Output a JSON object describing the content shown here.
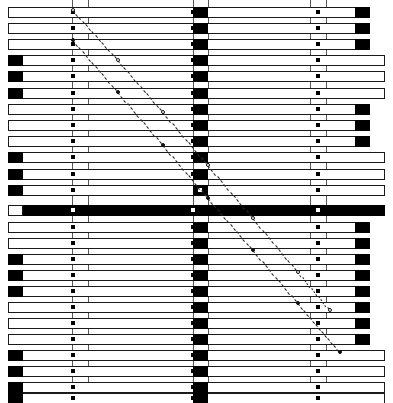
{
  "figure": {
    "title": "",
    "width": 393,
    "height": 403,
    "background": "#ffffff",
    "ink_color": "#000000",
    "grid_color": "#3a3a3a"
  },
  "chart_data": {
    "type": "bar",
    "orientation": "horizontal",
    "title": "",
    "subtitle": "",
    "xlabel": "",
    "ylabel": "",
    "grid": true,
    "legend": null,
    "xlim": [
      0,
      393
    ],
    "ylim": [
      0,
      25
    ],
    "vertical_gridlines": [
      72,
      88,
      193,
      208,
      310,
      326
    ],
    "marker_columns": [
      73,
      193,
      318
    ],
    "categories": [
      "row-01",
      "row-02",
      "row-03",
      "row-04",
      "row-05",
      "row-06",
      "row-07",
      "row-08",
      "row-09",
      "row-10",
      "row-11",
      "row-12",
      "row-13",
      "row-14",
      "row-15",
      "row-16",
      "row-17",
      "row-18",
      "row-19",
      "row-20",
      "row-21",
      "row-22",
      "row-23",
      "row-24",
      "row-25"
    ],
    "rows": [
      {
        "index": 1,
        "y": 7,
        "bar_start": 8,
        "bar_end": 370,
        "left_cap": false,
        "right_cap": true,
        "inverted": false,
        "markers": [
          73,
          193,
          318
        ]
      },
      {
        "index": 2,
        "y": 23,
        "bar_start": 8,
        "bar_end": 370,
        "left_cap": false,
        "right_cap": true,
        "inverted": false,
        "markers": [
          73,
          193,
          318
        ]
      },
      {
        "index": 3,
        "y": 39,
        "bar_start": 8,
        "bar_end": 370,
        "left_cap": false,
        "right_cap": true,
        "inverted": false,
        "markers": [
          73,
          193,
          318
        ]
      },
      {
        "index": 4,
        "y": 55,
        "bar_start": 8,
        "bar_end": 385,
        "left_cap": true,
        "right_cap": false,
        "inverted": false,
        "markers": [
          73,
          193,
          318
        ]
      },
      {
        "index": 5,
        "y": 71,
        "bar_start": 8,
        "bar_end": 385,
        "left_cap": true,
        "right_cap": false,
        "inverted": false,
        "markers": [
          73,
          193,
          318
        ]
      },
      {
        "index": 6,
        "y": 88,
        "bar_start": 8,
        "bar_end": 385,
        "left_cap": true,
        "right_cap": false,
        "inverted": false,
        "markers": [
          73,
          193,
          318
        ]
      },
      {
        "index": 7,
        "y": 104,
        "bar_start": 8,
        "bar_end": 370,
        "left_cap": false,
        "right_cap": true,
        "inverted": false,
        "markers": [
          73,
          193,
          318
        ]
      },
      {
        "index": 8,
        "y": 120,
        "bar_start": 8,
        "bar_end": 370,
        "left_cap": false,
        "right_cap": true,
        "inverted": false,
        "markers": [
          73,
          193,
          318
        ]
      },
      {
        "index": 9,
        "y": 136,
        "bar_start": 8,
        "bar_end": 370,
        "left_cap": false,
        "right_cap": true,
        "inverted": false,
        "markers": [
          73,
          193,
          318
        ]
      },
      {
        "index": 10,
        "y": 152,
        "bar_start": 8,
        "bar_end": 385,
        "left_cap": true,
        "right_cap": false,
        "inverted": false,
        "markers": [
          73,
          193,
          318
        ]
      },
      {
        "index": 11,
        "y": 169,
        "bar_start": 8,
        "bar_end": 385,
        "left_cap": true,
        "right_cap": false,
        "inverted": false,
        "markers": [
          73,
          193,
          318
        ]
      },
      {
        "index": 12,
        "y": 185,
        "bar_start": 8,
        "bar_end": 385,
        "left_cap": true,
        "right_cap": false,
        "inverted": false,
        "markers": [
          73,
          318
        ],
        "center_white_marker": true
      },
      {
        "index": 13,
        "y": 205,
        "bar_start": 8,
        "bar_end": 385,
        "left_cap": false,
        "right_cap": false,
        "inverted": true,
        "markers": [
          73,
          193,
          318
        ]
      },
      {
        "index": 14,
        "y": 222,
        "bar_start": 8,
        "bar_end": 370,
        "left_cap": false,
        "right_cap": true,
        "inverted": false,
        "markers": [
          73,
          193,
          318
        ]
      },
      {
        "index": 15,
        "y": 238,
        "bar_start": 8,
        "bar_end": 370,
        "left_cap": false,
        "right_cap": true,
        "inverted": false,
        "markers": [
          73,
          193,
          318
        ]
      },
      {
        "index": 16,
        "y": 254,
        "bar_start": 8,
        "bar_end": 370,
        "left_cap": true,
        "right_cap": true,
        "inverted": false,
        "markers": [
          73,
          193,
          318
        ]
      },
      {
        "index": 17,
        "y": 270,
        "bar_start": 8,
        "bar_end": 370,
        "left_cap": true,
        "right_cap": true,
        "inverted": false,
        "markers": [
          73,
          193,
          318
        ]
      },
      {
        "index": 18,
        "y": 286,
        "bar_start": 8,
        "bar_end": 370,
        "left_cap": true,
        "right_cap": true,
        "inverted": false,
        "markers": [
          73,
          193,
          318
        ]
      },
      {
        "index": 19,
        "y": 302,
        "bar_start": 8,
        "bar_end": 370,
        "left_cap": false,
        "right_cap": true,
        "inverted": false,
        "markers": [
          73,
          193,
          318
        ]
      },
      {
        "index": 20,
        "y": 318,
        "bar_start": 8,
        "bar_end": 370,
        "left_cap": false,
        "right_cap": true,
        "inverted": false,
        "markers": [
          73,
          193,
          318
        ]
      },
      {
        "index": 21,
        "y": 334,
        "bar_start": 8,
        "bar_end": 370,
        "left_cap": false,
        "right_cap": true,
        "inverted": false,
        "markers": [
          73,
          193,
          318
        ]
      },
      {
        "index": 22,
        "y": 350,
        "bar_start": 8,
        "bar_end": 385,
        "left_cap": true,
        "right_cap": false,
        "inverted": false,
        "markers": [
          73,
          193,
          318
        ]
      },
      {
        "index": 23,
        "y": 366,
        "bar_start": 8,
        "bar_end": 385,
        "left_cap": true,
        "right_cap": false,
        "inverted": false,
        "markers": [
          73,
          193,
          318
        ]
      },
      {
        "index": 24,
        "y": 382,
        "bar_start": 8,
        "bar_end": 385,
        "left_cap": true,
        "right_cap": false,
        "inverted": false,
        "markers": [
          73,
          193,
          318
        ]
      },
      {
        "index": 25,
        "y": 393,
        "bar_start": 8,
        "bar_end": 385,
        "left_cap": true,
        "right_cap": false,
        "inverted": false,
        "markers": [
          73,
          193,
          318
        ]
      }
    ],
    "series": [
      {
        "name": "diagonal-upper",
        "type": "line",
        "style": "dashed",
        "x": [
          73,
          118,
          163,
          208,
          253,
          298,
          330
        ],
        "y": [
          10,
          60,
          112,
          165,
          218,
          272,
          310
        ],
        "marker": "circle-hollow"
      },
      {
        "name": "diagonal-lower",
        "type": "line",
        "style": "dashed",
        "x": [
          73,
          118,
          163,
          208,
          253,
          298,
          340
        ],
        "y": [
          40,
          92,
          145,
          198,
          250,
          303,
          352
        ],
        "marker": "circle-solid"
      }
    ]
  }
}
